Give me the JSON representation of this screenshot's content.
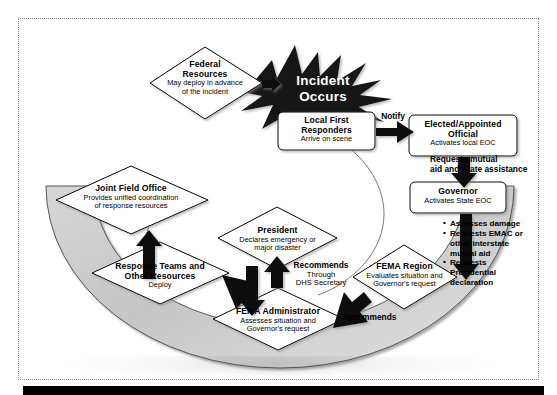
{
  "diagram": {
    "burst": {
      "line1": "Incident",
      "line2": "Occurs"
    },
    "nodes": [
      {
        "id": "federal-resources",
        "shape": "diamond",
        "title": "Federal\nResources",
        "sub": "May deploy in advance\nof the incident"
      },
      {
        "id": "local-first-responders",
        "shape": "rounded-box",
        "title": "Local First\nResponders",
        "sub": "Arrive on scene"
      },
      {
        "id": "elected-appointed-official",
        "shape": "rounded-box",
        "title": "Elected/Appointed\nOfficial",
        "sub": "Activates local EOC"
      },
      {
        "id": "governor",
        "shape": "rounded-box",
        "title": "Governor",
        "sub": "Activates State EOC"
      },
      {
        "id": "fema-region",
        "shape": "diamond",
        "title": "FEMA Region",
        "sub": "Evaluates situation and\nGovernor's request"
      },
      {
        "id": "fema-administrator",
        "shape": "diamond",
        "title": "FEMA Administrator",
        "sub": "Assesses situation and\nGovernor's request"
      },
      {
        "id": "president",
        "shape": "diamond",
        "title": "President",
        "sub": "Declares emergency or\nmajor disaster"
      },
      {
        "id": "response-teams",
        "shape": "diamond",
        "title": "Response Teams and\nOther Resources",
        "sub": "Deploy"
      },
      {
        "id": "joint-field-office",
        "shape": "diamond",
        "title": "Joint Field Office",
        "sub": "Provides unified coordination\nof response resources"
      }
    ],
    "connector_labels": [
      {
        "id": "notify",
        "text": "Notify"
      },
      {
        "id": "requests-mutual-aid",
        "text": "Requests mutual\naid and State assistance"
      },
      {
        "id": "recommends-region",
        "text": "Recommends"
      },
      {
        "id": "recommends-dhs",
        "text": "Recommends",
        "sub": "Through\nDHS Secretary"
      }
    ],
    "governor_actions": [
      "Assesses damage",
      "Requests EMAC or other interstate mutual aid",
      "Requests Presidential declaration"
    ],
    "governor_actions_lines": [
      [
        "Assesses damage"
      ],
      [
        "Requests EMAC or",
        "other interstate",
        "mutual aid"
      ],
      [
        "Requests",
        "Presidential",
        "declaration"
      ]
    ],
    "colors": {
      "ring_fill": "#c9c9c9",
      "arrow_fill": "#000000",
      "node_fill": "#ffffff",
      "node_stroke": "#000000",
      "burst_fill": "#111111",
      "frame_stroke": "#8d8d8d",
      "bottom_bar": "#000000"
    }
  }
}
